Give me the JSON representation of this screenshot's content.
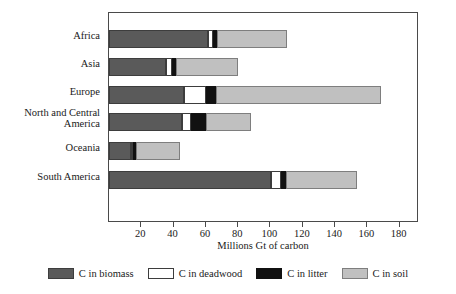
{
  "chart_data": {
    "type": "bar",
    "orientation": "horizontal",
    "stacked": true,
    "title": "",
    "xlabel": "Millions Gt of carbon",
    "ylabel": "",
    "xlim": [
      0,
      192
    ],
    "xticks": [
      20,
      40,
      60,
      80,
      100,
      120,
      140,
      160,
      180
    ],
    "grid": false,
    "legend_position": "bottom",
    "categories": [
      "Africa",
      "Asia",
      "Europe",
      "North and Central\nAmerica",
      "Oceania",
      "South America"
    ],
    "series": [
      {
        "name": "C in biomass",
        "color": "#5a5a5a",
        "values": [
          61.5,
          35.0,
          46.5,
          45.0,
          13.5,
          100.5
        ]
      },
      {
        "name": "C in deadwood",
        "color": "#ffffff",
        "values": [
          3.0,
          4.0,
          13.5,
          6.0,
          1.0,
          6.0
        ]
      },
      {
        "name": "C in litter",
        "color": "#111111",
        "values": [
          2.5,
          2.5,
          6.0,
          9.0,
          2.0,
          3.0
        ]
      },
      {
        "name": "C in soil",
        "color": "#c0c0c0",
        "values": [
          43.0,
          38.5,
          102.5,
          28.0,
          27.0,
          44.0
        ]
      }
    ],
    "totals": [
      110.0,
      80.0,
      168.5,
      88.0,
      43.5,
      153.5
    ]
  },
  "legend": {
    "items": [
      {
        "label": "C in biomass",
        "swatch": "biomass"
      },
      {
        "label": "C in deadwood",
        "swatch": "deadwood"
      },
      {
        "label": "C in litter",
        "swatch": "litter"
      },
      {
        "label": "C in soil",
        "swatch": "soil"
      }
    ]
  }
}
